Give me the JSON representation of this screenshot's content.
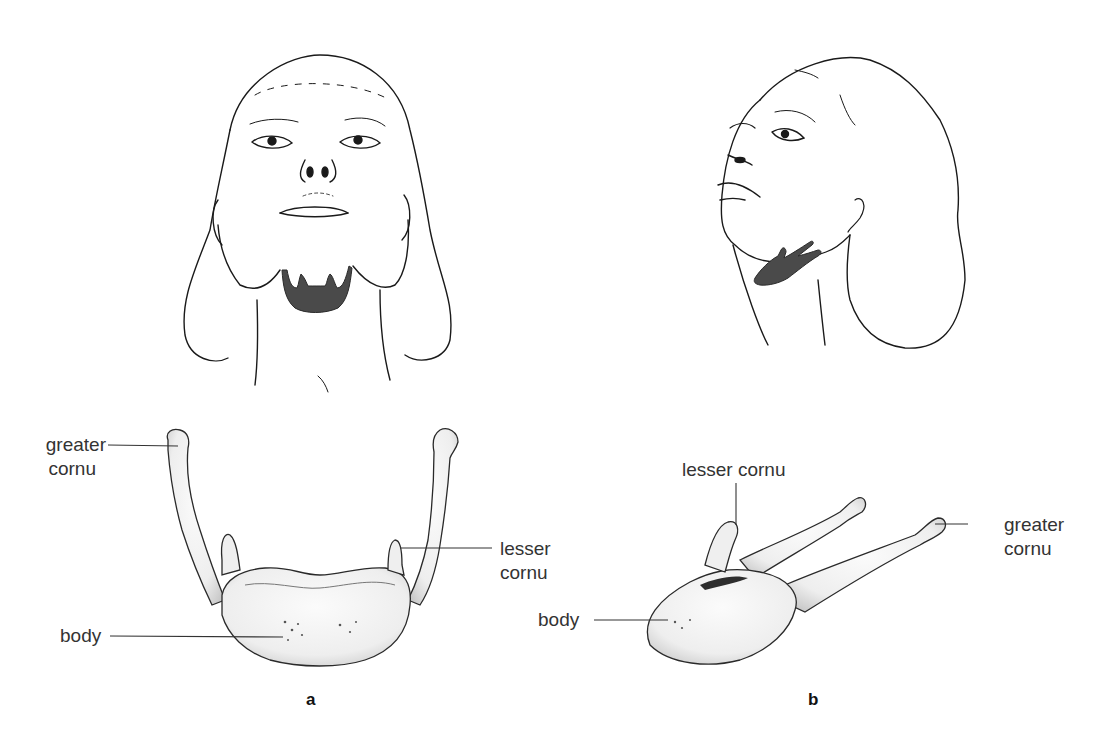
{
  "figure": {
    "panels": [
      {
        "id": "a",
        "letter": "a",
        "view": "front view, head tilted back",
        "labels": {
          "greater_cornu_line1": "greater",
          "greater_cornu_line2": "cornu",
          "lesser_cornu_line1": "lesser",
          "lesser_cornu_line2": "cornu",
          "body": "body"
        }
      },
      {
        "id": "b",
        "letter": "b",
        "view": "three-quarter view, head tilted back",
        "labels": {
          "lesser_cornu": "lesser cornu",
          "greater_cornu_line1": "greater",
          "greater_cornu_line2": "cornu",
          "body": "body"
        }
      }
    ],
    "colors": {
      "line": "#1a1a1a",
      "hyoid_highlight": "#4a4a4a",
      "bone_shade": "#d8d8d8",
      "bone_fill": "#f6f6f6",
      "label_text": "#333333"
    }
  }
}
